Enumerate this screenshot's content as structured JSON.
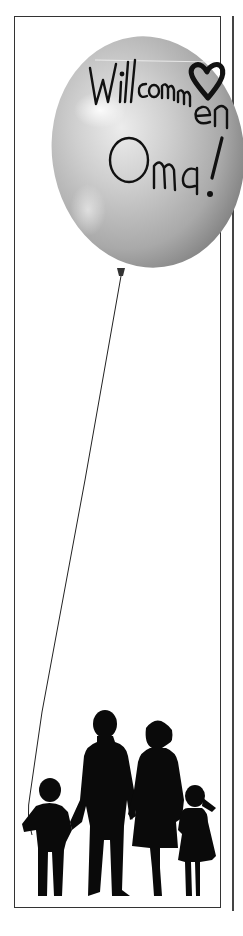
{
  "card": {
    "balloon_text_line1": "Willcommen",
    "balloon_text_line2": "Oma!",
    "balloon_symbol": "heart-icon",
    "full_message": "Willcommen Oma!",
    "illustration": "family-silhouette",
    "figures": [
      "boy",
      "father",
      "mother",
      "girl"
    ]
  },
  "colors": {
    "balloon_light": "#e6e6e6",
    "balloon_mid": "#b4b4b4",
    "balloon_dark": "#7a7a7a",
    "ink": "#111111",
    "frame": "#333333",
    "background": "#ffffff"
  }
}
